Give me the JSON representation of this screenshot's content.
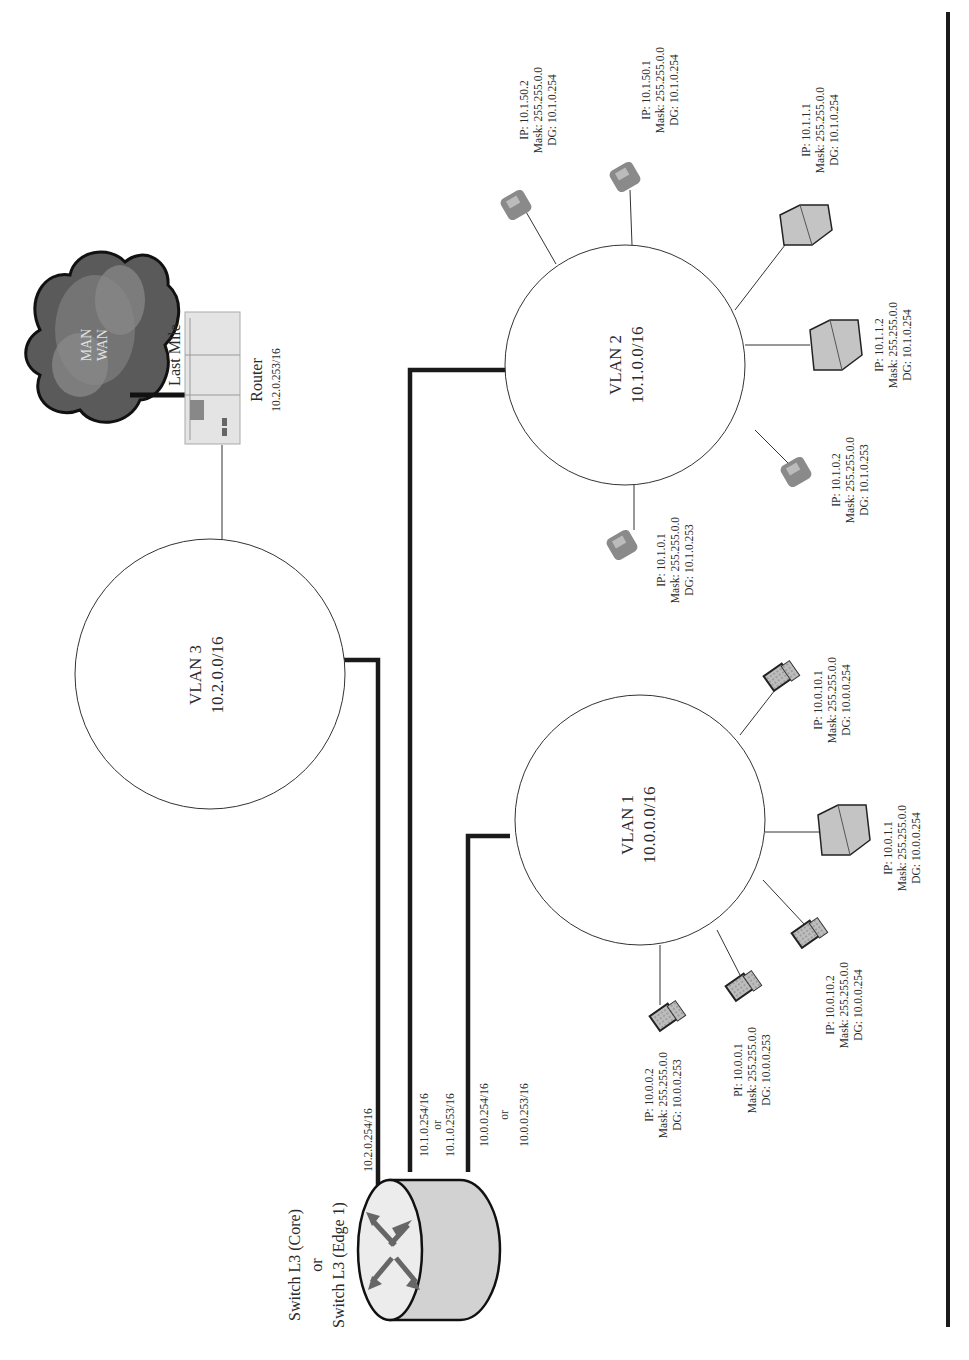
{
  "diagram": {
    "orientation": "rotated-90-ccw",
    "switch": {
      "label_line1": "Switch L3 (Core)",
      "label_line2": "or",
      "label_line3": "Switch L3 (Edge 1)"
    },
    "links": {
      "vlan3_ip": "10.2.0.254/16",
      "vlan2_ip1": "10.1.0.254/16",
      "vlan2_or": "or",
      "vlan2_ip2": "10.1.0.253/16",
      "vlan1_ip1": "10.0.0.254/16",
      "vlan1_or": "or",
      "vlan1_ip2": "10.0.0.253/16"
    },
    "wan": {
      "cloud_line1": "MAN",
      "cloud_line2": "WAN",
      "last_mile": "Last Mile",
      "router_label": "Router",
      "router_ip": "10.2.0.253/16"
    },
    "vlans": [
      {
        "name": "VLAN 3",
        "subnet": "10.2.0.0/16"
      },
      {
        "name": "VLAN 2",
        "subnet": "10.1.0.0/16"
      },
      {
        "name": "VLAN 1",
        "subnet": "10.0.0.0/16"
      }
    ],
    "vlan2_hosts": [
      {
        "type": "phone",
        "ip": "IP: 10.1.50.2",
        "mask": "Mask: 255.255.0.0",
        "dg": "DG: 10.1.0.254"
      },
      {
        "type": "phone",
        "ip": "IP: 10.1.50.1",
        "mask": "Mask: 255.255.0.0",
        "dg": "DG: 10.1.0.254"
      },
      {
        "type": "server",
        "ip": "IP: 10.1.1.1",
        "mask": "Mask: 255.255.0.0",
        "dg": "DG: 10.1.0.254"
      },
      {
        "type": "server",
        "ip": "IP: 10.1.1.2",
        "mask": "Mask: 255.255.0.0",
        "dg": "DG: 10.1.0.254"
      },
      {
        "type": "phone",
        "ip": "IP: 10.1.0.2",
        "mask": "Mask: 255.255.0.0",
        "dg": "DG: 10.1.0.253"
      },
      {
        "type": "phone",
        "ip": "IP: 10.1.0.1",
        "mask": "Mask: 255.255.0.0",
        "dg": "DG: 10.1.0.253"
      }
    ],
    "vlan1_hosts": [
      {
        "type": "laptop",
        "ip": "IP: 10.0.10.1",
        "mask": "Mask: 255.255.0.0",
        "dg": "DG: 10.0.0.254"
      },
      {
        "type": "server",
        "ip": "IP: 10.0.1.1",
        "mask": "Mask: 255.255.0.0",
        "dg": "DG: 10.0.0.254"
      },
      {
        "type": "laptop",
        "ip": "IP: 10.0.10.2",
        "mask": "Mask: 255.255.0.0",
        "dg": "DG: 10.0.0.254"
      },
      {
        "type": "laptop",
        "ip": "PI: 10.0.0.1",
        "mask": "Mask: 255.255.0.0",
        "dg": "DG: 10.0.0.253"
      },
      {
        "type": "laptop",
        "ip": "IP: 10.0.0.2",
        "mask": "Mask: 255.255.0.0",
        "dg": "DG: 10.0.0.253"
      }
    ],
    "colors": {
      "line": "#1a1a1a",
      "cloud": "#555555",
      "device_fill": "#c8c8c8"
    }
  }
}
